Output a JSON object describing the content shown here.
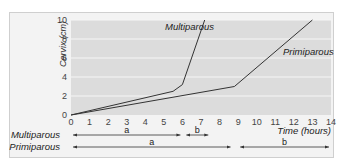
{
  "chart_data": {
    "type": "line",
    "title": "",
    "xlabel": "Time (hours)",
    "ylabel": "Cervix (cm)",
    "xlim": [
      0,
      14
    ],
    "ylim": [
      0,
      10
    ],
    "x_ticks": [
      "0",
      "1",
      "2",
      "3",
      "4",
      "5",
      "6",
      "7",
      "8",
      "9",
      "10",
      "11",
      "12",
      "13",
      "14"
    ],
    "y_ticks": [
      "0",
      "2",
      "4",
      "6",
      "8",
      "10"
    ],
    "grid": "horizontal bands",
    "series": [
      {
        "name": "Multiparous",
        "points": [
          [
            0,
            0
          ],
          [
            5.5,
            2.5
          ],
          [
            6,
            3.2
          ],
          [
            7.2,
            10
          ]
        ]
      },
      {
        "name": "Primiparous",
        "points": [
          [
            0,
            0
          ],
          [
            8.8,
            3
          ],
          [
            13,
            10
          ]
        ]
      }
    ],
    "phases": [
      {
        "group": "Multiparous",
        "segments": [
          {
            "label": "a",
            "from": 0,
            "to": 6
          },
          {
            "label": "b",
            "from": 6.1,
            "to": 7.5
          }
        ]
      },
      {
        "group": "Primiparous",
        "segments": [
          {
            "label": "a",
            "from": 0,
            "to": 8.7
          },
          {
            "label": "b",
            "from": 9,
            "to": 14
          }
        ]
      }
    ]
  },
  "labels": {
    "ylabel": "Cervix (cm)",
    "xlabel": "Time (hours)",
    "multiparous": "Multiparous",
    "primiparous": "Primiparous",
    "seg_a": "a",
    "seg_b": "b"
  }
}
